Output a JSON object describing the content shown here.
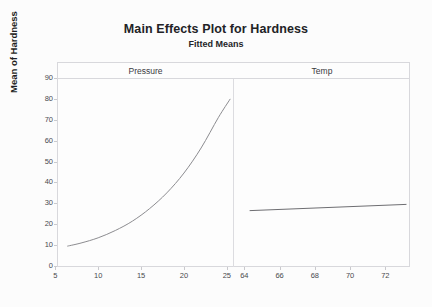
{
  "titles": {
    "main": "Main Effects Plot for Hardness",
    "sub": "Fitted Means"
  },
  "axes": {
    "y_title": "Mean of Hardness"
  },
  "panels": [
    {
      "name": "Pressure"
    },
    {
      "name": "Temp"
    }
  ],
  "chart_data": {
    "type": "line",
    "title": "Main Effects Plot for Hardness",
    "subtitle": "Fitted Means",
    "ylabel": "Mean of Hardness",
    "xlabel": "",
    "ylim": [
      0,
      90
    ],
    "yticks": [
      0,
      10,
      20,
      30,
      40,
      50,
      60,
      70,
      80,
      90
    ],
    "grid": false,
    "legend": null,
    "layout": "two-panel main effects plot, shared y axis",
    "panels": [
      {
        "name": "Pressure",
        "xlabel": "Pressure",
        "xlim": [
          5.2,
          25.6
        ],
        "xticks": [
          5,
          10,
          15,
          20,
          25
        ],
        "series": [
          {
            "name": "Mean of Hardness vs Pressure",
            "color": "#8c8c90",
            "x": [
              6.4,
              8,
              10,
              12,
              14,
              16,
              18,
              20,
              22,
              24,
              25.4
            ],
            "y": [
              9.5,
              11.0,
              13.5,
              17.0,
              21.5,
              27.5,
              35.0,
              44.5,
              56.5,
              71.0,
              80.0
            ]
          }
        ]
      },
      {
        "name": "Temp",
        "xlabel": "Temp",
        "xlim": [
          63.3,
          73.4
        ],
        "xticks": [
          64,
          66,
          68,
          70,
          72
        ],
        "series": [
          {
            "name": "Mean of Hardness vs Temp",
            "color": "#6e6e72",
            "x": [
              64.3,
              73.2
            ],
            "y": [
              26.5,
              29.5
            ]
          }
        ]
      }
    ]
  }
}
